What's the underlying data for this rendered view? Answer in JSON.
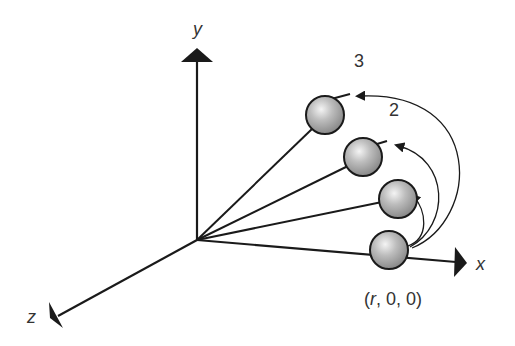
{
  "diagram": {
    "axes": {
      "x_label": "x",
      "y_label": "y",
      "z_label": "z"
    },
    "position_label": {
      "open": "(",
      "r": "r",
      "rest": ", 0, 0)"
    },
    "step_labels": [
      "2",
      "3"
    ],
    "colors": {
      "line": "#1a1a1a",
      "sphere_fill": "#b0b0b0",
      "sphere_highlight": "#f2f2f2",
      "text": "#333333"
    }
  }
}
